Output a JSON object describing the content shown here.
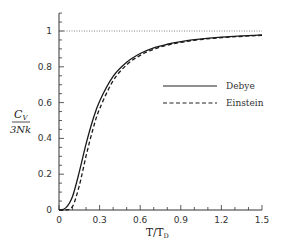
{
  "chart_data": {
    "type": "line",
    "title": "",
    "xlabel": "T/T_D",
    "ylabel": "C_V / 3Nk",
    "xlim": [
      0,
      1.5
    ],
    "ylim": [
      0,
      1.1
    ],
    "grid": false,
    "legend_position": "center-right",
    "x_ticks": [
      "0",
      "0.3",
      "0.6",
      "0.9",
      "1.2",
      "1.5"
    ],
    "y_ticks": [
      "0",
      "0.2",
      "0.4",
      "0.6",
      "0.8",
      "1"
    ],
    "reference_line": {
      "y": 1,
      "style": "dotted"
    },
    "x": [
      0,
      0.05,
      0.1,
      0.15,
      0.2,
      0.25,
      0.3,
      0.4,
      0.5,
      0.6,
      0.7,
      0.8,
      0.9,
      1.0,
      1.2,
      1.5
    ],
    "series": [
      {
        "name": "Debye",
        "style": "solid",
        "values": [
          0,
          0.012,
          0.076,
          0.213,
          0.369,
          0.503,
          0.608,
          0.746,
          0.825,
          0.874,
          0.906,
          0.926,
          0.941,
          0.952,
          0.966,
          0.978
        ]
      },
      {
        "name": "Einstein",
        "style": "dashed",
        "values": [
          0,
          0.0,
          0.02,
          0.136,
          0.302,
          0.449,
          0.565,
          0.722,
          0.811,
          0.864,
          0.898,
          0.921,
          0.936,
          0.948,
          0.963,
          0.976
        ]
      }
    ]
  },
  "labels": {
    "ylabel_top": "C",
    "ylabel_sub": "V",
    "ylabel_bottom": "3Nk",
    "xlabel_main": "T/T",
    "xlabel_sub": "D",
    "legend_debye": "Debye",
    "legend_einstein": "Einstein"
  }
}
